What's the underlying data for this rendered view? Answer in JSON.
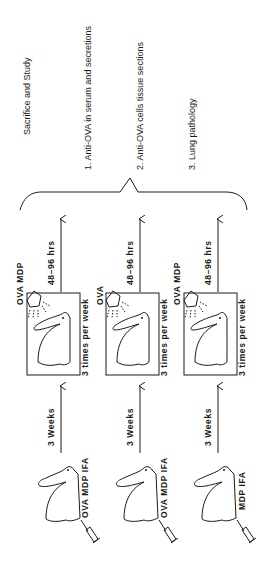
{
  "outcome": {
    "title": "Sacrifice and Study",
    "items": [
      "1. Anti-OVA in serum and secretions",
      "2. Anti-OVA cells tissue sections",
      "3. Lung pathology"
    ]
  },
  "groups": [
    {
      "immunization": "OVA MDP IFA",
      "interval": "3 Weeks",
      "challenge": "OVA MDP",
      "frequency": "3 times per week",
      "wait": "48–96 hrs"
    },
    {
      "immunization": "OVA MDP IFA",
      "interval": "3 Weeks",
      "challenge": "OVA",
      "frequency": "3 times per week",
      "wait": "48–96 hrs"
    },
    {
      "immunization": "MDP IFA",
      "interval": "3 Weeks",
      "challenge": "OVA MDP",
      "frequency": "3 times per week",
      "wait": "48–96 hrs"
    }
  ],
  "colors": {
    "ink": "#1a1a1a",
    "background": "#ffffff"
  }
}
